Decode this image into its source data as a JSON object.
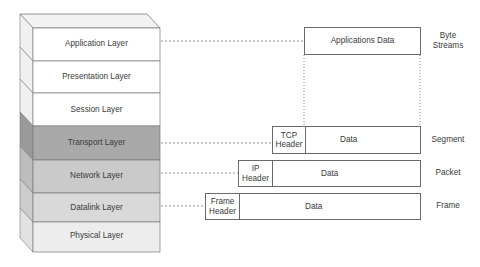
{
  "stack": {
    "layers": [
      {
        "name": "Application Layer",
        "fill": "#ffffff",
        "side": "#f0f0f0"
      },
      {
        "name": "Presentation Layer",
        "fill": "#ffffff",
        "side": "#f0f0f0"
      },
      {
        "name": "Session Layer",
        "fill": "#ffffff",
        "side": "#efefef"
      },
      {
        "name": "Transport Layer",
        "fill": "#a9a9a9",
        "side": "#9a9a9a"
      },
      {
        "name": "Network Layer",
        "fill": "#cacaca",
        "side": "#bdbdbd"
      },
      {
        "name": "Datalink Layer",
        "fill": "#d9d9d9",
        "side": "#cdcdcd"
      },
      {
        "name": "Physical Layer",
        "fill": "#ededed",
        "side": "#e2e2e2"
      }
    ],
    "top_fill": "#f2f2f2",
    "edge_color": "#7a7a7a"
  },
  "units": {
    "application": {
      "data": "Applications Data",
      "unit": "Byte Streams",
      "unit_lines": [
        "Byte",
        "Streams"
      ]
    },
    "transport": {
      "header_lines": [
        "TCP",
        "Header"
      ],
      "data": "Data",
      "unit": "Segment"
    },
    "network": {
      "header_lines": [
        "IP",
        "Header"
      ],
      "data": "Data",
      "unit": "Packet"
    },
    "datalink": {
      "header_lines": [
        "Frame",
        "Header"
      ],
      "data": "Data",
      "unit": "Frame"
    }
  },
  "colors": {
    "box_border": "#6a6a6a",
    "connector": "#777777"
  }
}
